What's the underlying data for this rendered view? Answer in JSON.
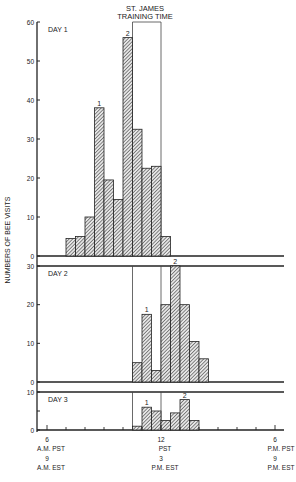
{
  "chart_data": {
    "type": "bar",
    "title": "ST. JAMES TRAINING TIME",
    "ylabel": "NUMBERS OF BEE VISITS",
    "xlabel": "",
    "bin_width_hours": 0.5,
    "x_ticks": [
      {
        "hour": 6,
        "top": "6",
        "mid": "A.M. PST",
        "est_num": "9",
        "est": "A.M. EST"
      },
      {
        "hour": 12,
        "top": "12",
        "mid": "PST",
        "est_num": "3",
        "est": "P.M. EST"
      },
      {
        "hour": 18,
        "top": "6",
        "mid": "P.M. PST",
        "est_num": "9",
        "est": "P.M. EST"
      }
    ],
    "training_window_hours": [
      10.5,
      12
    ],
    "panels": [
      {
        "label": "DAY 1",
        "ylim": [
          0,
          60
        ],
        "yticks": [
          0,
          10,
          20,
          30,
          40,
          50,
          60
        ],
        "start_hour": 7,
        "values": [
          4.5,
          5,
          10,
          38,
          19.5,
          14.5,
          56,
          32.5,
          22.5,
          23,
          5
        ],
        "annotations": [
          {
            "index": 3,
            "text": "1"
          },
          {
            "index": 6,
            "text": "2"
          }
        ]
      },
      {
        "label": "DAY 2",
        "ylim": [
          0,
          30
        ],
        "yticks": [
          0,
          10,
          20,
          30
        ],
        "start_hour": 10.5,
        "values": [
          5,
          17.5,
          3,
          20,
          30,
          20,
          10.5,
          6
        ],
        "annotations": [
          {
            "index": 1,
            "text": "1"
          },
          {
            "index": 4,
            "text": "2"
          }
        ]
      },
      {
        "label": "DAY 3",
        "ylim": [
          0,
          10
        ],
        "yticks": [
          0,
          5,
          10
        ],
        "ytick_labels": [
          "0",
          "",
          "10"
        ],
        "start_hour": 10.5,
        "values": [
          1,
          6,
          5,
          2.5,
          4.5,
          8,
          2.5
        ],
        "annotations": [
          {
            "index": 1,
            "text": "1"
          },
          {
            "index": 5,
            "text": "2"
          }
        ]
      }
    ]
  },
  "header": {
    "training_line1": "ST. JAMES",
    "training_line2": "TRAINING TIME"
  },
  "axis": {
    "ylabel": "NUMBERS OF BEE VISITS"
  }
}
